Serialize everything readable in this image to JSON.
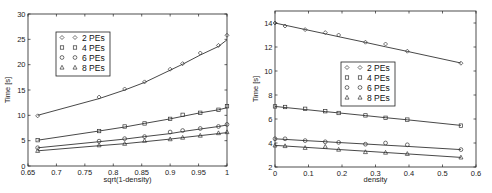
{
  "chart_data": [
    {
      "type": "line",
      "title": "",
      "xlabel": "sqrt(1-density)",
      "ylabel": "Time [s]",
      "xlim": [
        0.65,
        1.0
      ],
      "ylim": [
        0,
        30
      ],
      "xticks": [
        0.65,
        0.7,
        0.75,
        0.8,
        0.85,
        0.9,
        0.95,
        1
      ],
      "xtick_labels": [
        "0.65",
        "0.7",
        "0.75",
        "0.8",
        "0.85",
        "0.9",
        "0.95",
        "1"
      ],
      "yticks": [
        0,
        5,
        10,
        15,
        20,
        25,
        30
      ],
      "ytick_labels": [
        "0",
        "5",
        "10",
        "15",
        "20",
        "25",
        "30"
      ],
      "grid": false,
      "legend_position": "upper-left",
      "x": [
        0.667,
        0.775,
        0.82,
        0.855,
        0.9,
        0.922,
        0.953,
        0.985,
        1.0
      ],
      "series": [
        {
          "name": "2 PEs",
          "marker": "diamond",
          "values": [
            9.9,
            13.6,
            15.2,
            16.6,
            19.1,
            20.2,
            22.3,
            23.8,
            25.8
          ],
          "fit": [
            10.0,
            13.3,
            15.0,
            16.5,
            18.9,
            20.1,
            21.9,
            23.6,
            24.9
          ]
        },
        {
          "name": "4 PEs",
          "marker": "square",
          "values": [
            5.1,
            6.9,
            7.8,
            8.4,
            9.3,
            10.1,
            10.5,
            11.1,
            11.8
          ],
          "fit": [
            5.1,
            6.9,
            7.7,
            8.4,
            9.3,
            9.8,
            10.5,
            11.1,
            11.5
          ]
        },
        {
          "name": "6 PEs",
          "marker": "circle",
          "values": [
            3.6,
            4.9,
            5.4,
            5.8,
            6.7,
            7.0,
            7.4,
            7.8,
            8.2
          ],
          "fit": [
            3.6,
            4.8,
            5.3,
            5.8,
            6.4,
            6.8,
            7.3,
            7.8,
            8.1
          ]
        },
        {
          "name": "8 PEs",
          "marker": "triangle",
          "values": [
            3.0,
            4.1,
            4.4,
            5.0,
            5.3,
            5.6,
            6.0,
            6.5,
            6.7
          ],
          "fit": [
            3.0,
            4.0,
            4.4,
            4.8,
            5.3,
            5.6,
            6.0,
            6.4,
            6.6
          ]
        }
      ]
    },
    {
      "type": "line",
      "title": "",
      "xlabel": "density",
      "ylabel": "Time [s]",
      "xlim": [
        0,
        0.6
      ],
      "ylim": [
        2,
        15
      ],
      "xticks": [
        0,
        0.1,
        0.2,
        0.3,
        0.4,
        0.5,
        0.6
      ],
      "xtick_labels": [
        "0",
        "0.1",
        "0.2",
        "0.3",
        "0.4",
        "0.5",
        "0.6"
      ],
      "yticks": [
        2,
        4,
        6,
        8,
        10,
        12,
        14
      ],
      "ytick_labels": [
        "2",
        "4",
        "6",
        "8",
        "10",
        "12",
        "14"
      ],
      "grid": false,
      "legend_position": "center",
      "x": [
        0,
        0.03,
        0.09,
        0.15,
        0.19,
        0.27,
        0.33,
        0.395,
        0.555
      ],
      "series": [
        {
          "name": "2 PEs",
          "marker": "diamond",
          "values": [
            14.0,
            13.75,
            13.45,
            13.2,
            13.0,
            12.4,
            12.25,
            11.65,
            10.65
          ],
          "fit": [
            14.0,
            13.82,
            13.46,
            13.1,
            12.86,
            12.38,
            12.02,
            11.63,
            10.67
          ]
        },
        {
          "name": "4 PEs",
          "marker": "square",
          "values": [
            7.05,
            7.0,
            6.85,
            6.65,
            6.5,
            6.3,
            6.1,
            5.95,
            5.45
          ],
          "fit": [
            7.05,
            6.96,
            6.79,
            6.62,
            6.51,
            6.28,
            6.11,
            5.93,
            5.47
          ]
        },
        {
          "name": "6 PEs",
          "marker": "circle",
          "values": [
            4.35,
            4.35,
            4.2,
            4.1,
            4.05,
            3.9,
            4.0,
            3.85,
            3.45
          ],
          "fit": [
            4.35,
            4.3,
            4.2,
            4.11,
            4.04,
            3.92,
            3.82,
            3.72,
            3.45
          ]
        },
        {
          "name": "8 PEs",
          "marker": "triangle",
          "values": [
            3.8,
            3.75,
            3.6,
            3.7,
            3.45,
            3.25,
            3.2,
            3.1,
            2.8
          ],
          "fit": [
            3.8,
            3.75,
            3.64,
            3.53,
            3.46,
            3.32,
            3.21,
            3.09,
            2.8
          ]
        }
      ]
    }
  ]
}
